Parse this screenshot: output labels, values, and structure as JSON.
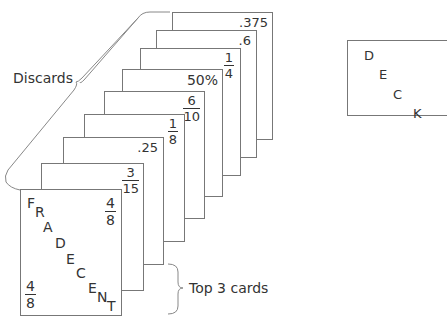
{
  "captions": {
    "discards": "Discards",
    "top_cards": "Top 3 cards"
  },
  "cards": [
    {
      "label": ".375",
      "type": "decimal"
    },
    {
      "label": ".6",
      "type": "decimal"
    },
    {
      "num": "1",
      "den": "4",
      "type": "fraction"
    },
    {
      "label": "50%",
      "type": "percent"
    },
    {
      "num": "6",
      "den": "10",
      "type": "fraction"
    },
    {
      "num": "1",
      "den": "8",
      "type": "fraction"
    },
    {
      "label": ".25",
      "type": "decimal"
    },
    {
      "num": "3",
      "den": "15",
      "type": "fraction"
    }
  ],
  "front_card": {
    "title_letters": [
      "F",
      "R",
      "A",
      "D",
      "E",
      "C",
      "E",
      "N",
      "T"
    ],
    "corner_top": {
      "num": "4",
      "den": "8"
    },
    "corner_bottom": {
      "num": "4",
      "den": "8"
    }
  },
  "deck": {
    "letters": [
      "D",
      "E",
      "C",
      "K"
    ]
  }
}
